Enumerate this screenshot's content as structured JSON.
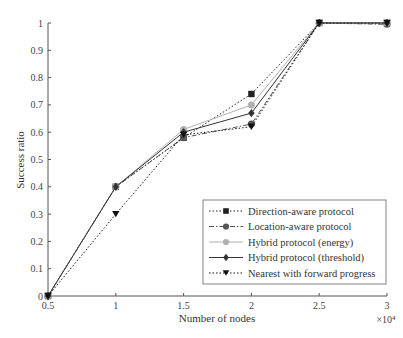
{
  "chart_data": {
    "type": "line",
    "title": "",
    "xlabel": "Number of nodes",
    "ylabel": "Success ratio",
    "x_multiplier": "×10⁴",
    "x": [
      0.5,
      1,
      1.5,
      2,
      2.5,
      3
    ],
    "xlim": [
      0.5,
      3
    ],
    "ylim": [
      0,
      1
    ],
    "xticks": [
      "0.5",
      "1",
      "1.5",
      "2",
      "2.5",
      "3"
    ],
    "yticks": [
      "0",
      "0.1",
      "0.2",
      "0.3",
      "0.4",
      "0.5",
      "0.6",
      "0.7",
      "0.8",
      "0.9",
      "1"
    ],
    "grid": false,
    "legend_position": "lower right",
    "series": [
      {
        "name": "Direction-aware protocol",
        "values": [
          0,
          0.4,
          0.58,
          0.74,
          1.0,
          1.0
        ],
        "marker": "square",
        "line": "dotted",
        "color": "#222222"
      },
      {
        "name": "Location-aware protocol",
        "values": [
          0,
          0.4,
          0.58,
          0.63,
          1.0,
          0.995
        ],
        "marker": "circle",
        "line": "dashdot",
        "color": "#555555"
      },
      {
        "name": "Hybrid protocol (energy)",
        "values": [
          0,
          0.4,
          0.61,
          0.7,
          1.0,
          1.0
        ],
        "marker": "circle",
        "line": "solid",
        "color": "#b0b0b0"
      },
      {
        "name": "Hybrid protocol (threshold)",
        "values": [
          0,
          0.4,
          0.6,
          0.67,
          1.0,
          1.0
        ],
        "marker": "diamond",
        "line": "solid",
        "color": "#333333"
      },
      {
        "name": "Nearest with forward progress",
        "values": [
          0,
          0.3,
          0.59,
          0.62,
          1.0,
          1.0
        ],
        "marker": "triangle-down",
        "line": "dotted",
        "color": "#111111"
      }
    ]
  }
}
